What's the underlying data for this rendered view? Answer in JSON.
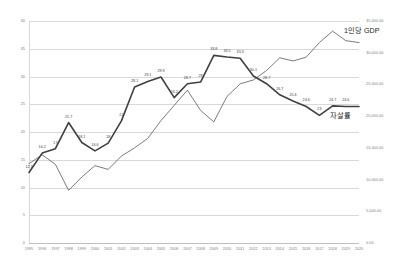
{
  "chart_data": {
    "type": "line",
    "title": "",
    "xlabel": "",
    "grid": true,
    "legend_position": "inline-annotation",
    "x": [
      1995,
      1996,
      1997,
      1998,
      1999,
      2000,
      2001,
      2002,
      2003,
      2004,
      2005,
      2006,
      2007,
      2008,
      2009,
      2010,
      2011,
      2012,
      2013,
      2014,
      2015,
      2016,
      2017,
      2018,
      2019,
      2020
    ],
    "axes": {
      "left": {
        "label": "자살률",
        "ylim": [
          0,
          40
        ],
        "ticks": [
          0,
          5,
          10,
          15,
          20,
          25,
          30,
          35,
          40
        ],
        "ticklabels": [
          "0",
          "5",
          "10",
          "15",
          "20",
          "25",
          "30",
          "35",
          "40"
        ]
      },
      "right": {
        "label": "1인당 GDP",
        "ylim": [
          0,
          35000
        ],
        "ticks": [
          0,
          5000,
          10000,
          15000,
          20000,
          25000,
          30000,
          35000
        ],
        "ticklabels": [
          "0.00",
          "5,000.00",
          "10,000.00",
          "15,000.00",
          "20,000.00",
          "25,000.00",
          "30,000.00",
          "35,000.00"
        ]
      }
    },
    "series": [
      {
        "name": "자살률",
        "axis": "left",
        "emphasis": "bold",
        "values": [
          12.7,
          16.2,
          17.0,
          21.7,
          18.1,
          16.6,
          18.0,
          22.0,
          28.1,
          29.1,
          29.9,
          26.2,
          28.7,
          29.0,
          33.8,
          33.5,
          33.3,
          30.1,
          28.7,
          26.7,
          25.6,
          24.6,
          23.0,
          24.7,
          24.6,
          24.6
        ],
        "point_labels": [
          "12.7",
          "16.2",
          "17",
          "21.7",
          "18.1",
          "16.6",
          "18",
          "22",
          "28.1",
          "29.1",
          "29.9",
          "26.2",
          "28.7",
          "29",
          "33.8",
          "33.5",
          "33.3",
          "30.1",
          "28.7",
          "26.7",
          "25.6",
          "24.6",
          "23",
          "24.7",
          "24.6",
          ""
        ]
      },
      {
        "name": "1인당 GDP",
        "axis": "right",
        "emphasis": "thin",
        "values": [
          12500,
          13900,
          12400,
          8300,
          10400,
          12200,
          11600,
          13700,
          15000,
          16500,
          19300,
          21700,
          24100,
          20900,
          19100,
          23100,
          25100,
          25700,
          27200,
          29200,
          28700,
          29300,
          31600,
          33400,
          31900,
          31600
        ],
        "point_labels": []
      }
    ]
  }
}
